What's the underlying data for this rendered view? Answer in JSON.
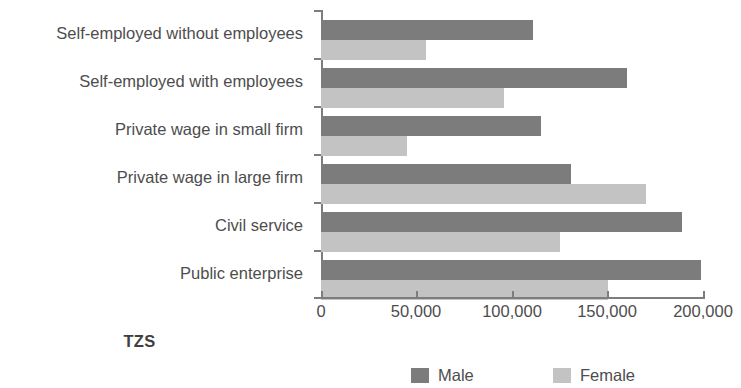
{
  "chart_data": {
    "type": "bar",
    "orientation": "horizontal",
    "title": "",
    "xlabel": "TZS",
    "ylabel": "",
    "xlim": [
      0,
      200000
    ],
    "xticks": [
      0,
      50000,
      100000,
      150000,
      200000
    ],
    "xtick_labels": [
      "0",
      "50,000",
      "100,000",
      "150,000",
      "200,000"
    ],
    "grid": false,
    "legend_position": "bottom",
    "categories": [
      "Self-employed without employees",
      "Self-employed with employees",
      "Private wage in small firm",
      "Private wage in large firm",
      "Civil service",
      "Public enterprise"
    ],
    "series": [
      {
        "name": "Male",
        "color": "#7c7c7c",
        "values": [
          111000,
          160000,
          115000,
          131000,
          189000,
          199000
        ]
      },
      {
        "name": "Female",
        "color": "#c3c3c3",
        "values": [
          55000,
          96000,
          45000,
          170000,
          125000,
          150000
        ]
      }
    ]
  },
  "axis": {
    "title": "TZS"
  },
  "legend": {
    "items": [
      {
        "label": "Male",
        "swatch": "male-swatch"
      },
      {
        "label": "Female",
        "swatch": "female-swatch"
      }
    ]
  }
}
